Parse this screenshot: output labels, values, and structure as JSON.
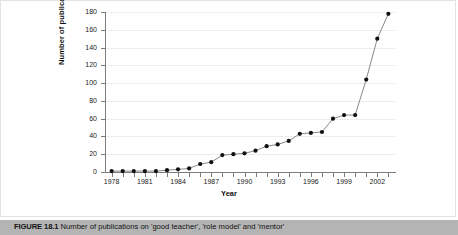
{
  "figure": {
    "caption_label": "FIGURE 18.1",
    "caption_text": "Number of publications on 'good teacher', 'role model' and 'mentor'"
  },
  "chart_data": {
    "type": "line",
    "title": "",
    "xlabel": "Year",
    "ylabel": "Number of publications",
    "xlim": [
      1977.4,
      2003.6
    ],
    "ylim": [
      0,
      180
    ],
    "grid": true,
    "legend": "none",
    "marker": "filled-circle",
    "line_color": "#7a7a7a",
    "marker_color": "#111111",
    "ytick_labels": [
      "0",
      "20",
      "40",
      "60",
      "80",
      "100",
      "120",
      "140",
      "160",
      "180"
    ],
    "yticks": [
      0,
      20,
      40,
      60,
      80,
      100,
      120,
      140,
      160,
      180
    ],
    "xtick_labels": [
      "1978",
      "1981",
      "1984",
      "1987",
      "1990",
      "1993",
      "1996",
      "1999",
      "2002"
    ],
    "xticks": [
      1978,
      1981,
      1984,
      1987,
      1990,
      1993,
      1996,
      1999,
      2002
    ],
    "x": [
      1978,
      1979,
      1980,
      1981,
      1982,
      1983,
      1984,
      1985,
      1986,
      1987,
      1988,
      1989,
      1990,
      1991,
      1992,
      1993,
      1994,
      1995,
      1996,
      1997,
      1998,
      1999,
      2000,
      2001,
      2002,
      2003
    ],
    "values": [
      1,
      1,
      1,
      1,
      1,
      2,
      3,
      4,
      9,
      11,
      19,
      20,
      21,
      24,
      29,
      31,
      35,
      43,
      44,
      45,
      60,
      64,
      64,
      104,
      150,
      178
    ]
  }
}
